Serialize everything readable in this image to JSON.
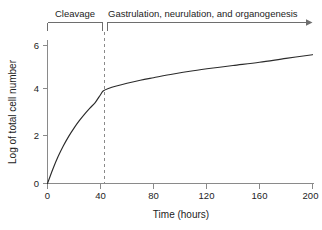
{
  "chart_data": {
    "type": "line",
    "title": "",
    "xlabel": "Time (hours)",
    "ylabel": "Log of total cell number",
    "xlim": [
      0,
      210
    ],
    "ylim": [
      0,
      6.4
    ],
    "xticks": [
      0,
      40,
      80,
      120,
      160,
      200
    ],
    "yticks": [
      0,
      2,
      4,
      6
    ],
    "grid": false,
    "legend": false,
    "series": [
      {
        "name": "Log of total cell number",
        "x": [
          0,
          4,
          8,
          12,
          16,
          20,
          24,
          28,
          32,
          36,
          40,
          42,
          46,
          52,
          60,
          70,
          80,
          95,
          110,
          125,
          140,
          160,
          180,
          200
        ],
        "y": [
          0,
          0.62,
          1.17,
          1.64,
          2.05,
          2.41,
          2.73,
          3.02,
          3.28,
          3.52,
          3.86,
          4.02,
          4.13,
          4.24,
          4.36,
          4.49,
          4.6,
          4.76,
          4.9,
          5.02,
          5.13,
          5.27,
          5.44,
          5.6
        ]
      }
    ],
    "annotations": [
      {
        "name": "cleavage-phase",
        "label": "Cleavage",
        "x_start": 0,
        "x_end": 42,
        "bracket_style": "square-down"
      },
      {
        "name": "gastrulation-phase",
        "label": "Gastrulation, neurulation, and organogenesis",
        "x_start": 42,
        "x_end": 210,
        "bracket_style": "arrow-right"
      },
      {
        "name": "phase-divider",
        "label": "",
        "x": 42,
        "style": "dashed-vertical"
      }
    ]
  },
  "axes": {
    "x": {
      "title": "Time (hours)",
      "tick_labels": [
        "0",
        "40",
        "80",
        "120",
        "160",
        "200"
      ]
    },
    "y": {
      "title": "Log of total cell number",
      "tick_labels": [
        "0",
        "2",
        "4",
        "6"
      ]
    }
  },
  "annotations": {
    "cleavage_label": "Cleavage",
    "gastrulation_label": "Gastrulation, neurulation, and organogenesis"
  },
  "colors": {
    "background": "#ffffff",
    "curve": "#2b2b2b",
    "axis": "#8a8a8a",
    "text": "#232323",
    "dashed": "#8a8a8a"
  }
}
